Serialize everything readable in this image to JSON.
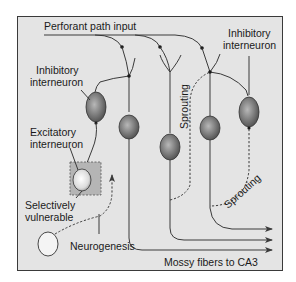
{
  "diagram": {
    "colors": {
      "background": "#e4e4e4",
      "frame": "#3a3a3a",
      "neuron_fill": "#7a7a7a",
      "neuron_dark": "#4a4a4a",
      "vulnerable_box": "#b5b5b5"
    },
    "labels": {
      "perforant_path": "Perforant path input",
      "inhibitory_left_1": "Inhibitory",
      "inhibitory_left_2": "interneuron",
      "inhibitory_right_1": "Inhibitory",
      "inhibitory_right_2": "interneuron",
      "excitatory_1": "Excitatory",
      "excitatory_2": "interneuron",
      "vulnerable_1": "Selectively",
      "vulnerable_2": "vulnerable",
      "neurogenesis": "Neurogenesis",
      "sprouting_vertical": "Sprouting",
      "sprouting_curved": "Sprouting",
      "mossy_fibers": "Mossy fibers to CA3"
    },
    "nodes": [
      {
        "id": "inhibitory-interneuron-left",
        "type": "inhibitory interneuron"
      },
      {
        "id": "granule-cell-1",
        "type": "granule cell"
      },
      {
        "id": "granule-cell-2",
        "type": "granule cell"
      },
      {
        "id": "granule-cell-3",
        "type": "granule cell"
      },
      {
        "id": "inhibitory-interneuron-right",
        "type": "inhibitory interneuron"
      },
      {
        "id": "excitatory-interneuron",
        "type": "excitatory interneuron (selectively vulnerable)"
      },
      {
        "id": "newborn-neuron",
        "type": "new neuron (neurogenesis)"
      }
    ],
    "edges": [
      {
        "from": "perforant-path",
        "to": "granule-cell-1"
      },
      {
        "from": "perforant-path",
        "to": "granule-cell-2"
      },
      {
        "from": "perforant-path",
        "to": "granule-cell-3"
      },
      {
        "from": "perforant-path",
        "to": "inhibitory-interneuron-left"
      },
      {
        "from": "perforant-path",
        "to": "inhibitory-interneuron-right"
      },
      {
        "from": "granule-cell-1",
        "to": "CA3",
        "label": "Mossy fibers"
      },
      {
        "from": "granule-cell-2",
        "to": "CA3"
      },
      {
        "from": "granule-cell-3",
        "to": "CA3"
      },
      {
        "from": "granule-cell-2",
        "to": "granule-cell-3",
        "style": "dashed",
        "label": "Sprouting"
      },
      {
        "from": "inhibitory-interneuron-right",
        "to": "granule-cell-3",
        "style": "dashed",
        "label": "Sprouting"
      },
      {
        "from": "newborn-neuron",
        "to": "granule-layer",
        "style": "dashed",
        "label": "Neurogenesis"
      }
    ]
  }
}
